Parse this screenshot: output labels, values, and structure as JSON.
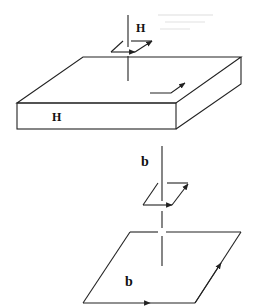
{
  "diagram": {
    "top_figure": {
      "description": "Conducting slab with magnetic field line H and a small Amperian loop above; surface current arrow on top face",
      "field_label": "H",
      "slab_label": "H"
    },
    "bottom_figure": {
      "description": "Field line b piercing a small loop and a large loop, each with circulation arrows",
      "field_label": "b",
      "loop_label": "b"
    },
    "colors": {
      "line": "#222222",
      "background": "#ffffff"
    }
  }
}
